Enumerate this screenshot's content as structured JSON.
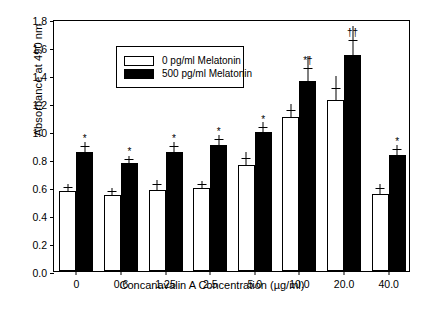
{
  "chart_data": {
    "type": "bar",
    "title": "",
    "xlabel": "Concanavalin A Concentration (µg/ml)",
    "ylabel": "Absorbance at 490 nm",
    "categories": [
      "0",
      "0.6",
      "1.25",
      "2.5",
      "5.0",
      "10.0",
      "20.0",
      "40.0"
    ],
    "ylim": [
      0.0,
      1.8
    ],
    "yticks": [
      "0.0",
      "0.2",
      "0.4",
      "0.6",
      "0.8",
      "1.0",
      "1.2",
      "1.4",
      "1.6",
      "1.8"
    ],
    "grid": false,
    "legend_position": "top-left",
    "series": [
      {
        "name": "0 pg/ml Melatonin",
        "style": "open",
        "values": [
          0.57,
          0.54,
          0.58,
          0.59,
          0.76,
          1.1,
          1.22,
          0.55
        ],
        "errors": [
          0.03,
          0.03,
          0.04,
          0.03,
          0.05,
          0.05,
          0.09,
          0.04
        ],
        "annotations": [
          "",
          "",
          "",
          "",
          "",
          "",
          "",
          ""
        ]
      },
      {
        "name": "500 pg/ml Melatonin",
        "style": "filled",
        "values": [
          0.85,
          0.77,
          0.85,
          0.9,
          0.99,
          1.36,
          1.54,
          0.83
        ],
        "errors": [
          0.04,
          0.03,
          0.04,
          0.04,
          0.04,
          0.09,
          0.11,
          0.04
        ],
        "annotations": [
          "*",
          "*",
          "*",
          "*",
          "*",
          "*†",
          "††",
          "*"
        ]
      }
    ]
  },
  "legend": {
    "items": [
      {
        "label": "0 pg/ml Melatonin",
        "style": "open"
      },
      {
        "label": "500 pg/ml Melatonin",
        "style": "filled"
      }
    ]
  },
  "colors": {
    "axis": "#000000",
    "open_bar": "#ffffff",
    "filled_bar": "#000000",
    "background": "#ffffff"
  }
}
